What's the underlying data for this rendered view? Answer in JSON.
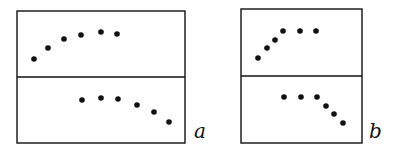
{
  "figure": {
    "panels": [
      {
        "id": "a",
        "label": "a",
        "box": {
          "x": 17,
          "y": 11,
          "w": 168,
          "h": 132,
          "divider_y": 77
        },
        "label_pos": {
          "x": 194,
          "y": 138
        },
        "top_points": [
          [
            34,
            59
          ],
          [
            48,
            48
          ],
          [
            64,
            39
          ],
          [
            81,
            35
          ],
          [
            101,
            32
          ],
          [
            117,
            34
          ]
        ],
        "bottom_points": [
          [
            82,
            100
          ],
          [
            101,
            98
          ],
          [
            118,
            99
          ],
          [
            137,
            105
          ],
          [
            154,
            112
          ],
          [
            169,
            122
          ]
        ]
      },
      {
        "id": "b",
        "label": "b",
        "box": {
          "x": 241,
          "y": 9,
          "w": 121,
          "h": 134,
          "divider_y": 76
        },
        "label_pos": {
          "x": 369,
          "y": 138
        },
        "top_points": [
          [
            258,
            58
          ],
          [
            267,
            48
          ],
          [
            275,
            40
          ],
          [
            283,
            31
          ],
          [
            300,
            31
          ],
          [
            316,
            31
          ]
        ],
        "bottom_points": [
          [
            284,
            97
          ],
          [
            301,
            97
          ],
          [
            317,
            97
          ],
          [
            326,
            106
          ],
          [
            334,
            114
          ],
          [
            343,
            123
          ]
        ]
      }
    ]
  },
  "chart_data": [
    {
      "type": "scatter",
      "title": "a",
      "subplots": [
        {
          "position": "top",
          "x": [
            1,
            2,
            3,
            4,
            5,
            6
          ],
          "y": [
            1.0,
            2.3,
            3.4,
            3.9,
            4.2,
            4.0
          ],
          "description": "rising then leveling (concave)"
        },
        {
          "position": "bottom",
          "x": [
            4,
            5,
            6,
            7,
            8,
            9
          ],
          "y": [
            4.2,
            4.4,
            4.3,
            3.6,
            2.8,
            1.6
          ],
          "description": "flat then falling"
        }
      ],
      "xlabel": "",
      "ylabel": "",
      "grid": false
    },
    {
      "type": "scatter",
      "title": "b",
      "subplots": [
        {
          "position": "top",
          "x": [
            1,
            2,
            3,
            4,
            5,
            6
          ],
          "y": [
            1.0,
            2.2,
            3.1,
            4.1,
            4.1,
            4.1
          ],
          "description": "steep rise then plateau"
        },
        {
          "position": "bottom",
          "x": [
            4,
            5,
            6,
            7,
            8,
            9
          ],
          "y": [
            4.1,
            4.1,
            4.1,
            3.0,
            2.1,
            1.0
          ],
          "description": "plateau then steep fall"
        }
      ],
      "xlabel": "",
      "ylabel": "",
      "grid": false
    }
  ]
}
